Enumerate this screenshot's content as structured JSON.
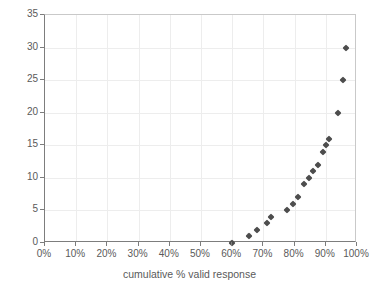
{
  "chart_data": {
    "type": "scatter",
    "title": "",
    "xlabel": "cumulative % valid response",
    "ylabel": "",
    "xlim": [
      0,
      100
    ],
    "ylim": [
      0,
      35
    ],
    "grid": true,
    "legend": null,
    "marker": {
      "shape": "diamond",
      "color": "#4d4d4d",
      "size_px": 5
    },
    "xtick_labels": [
      "0%",
      "10%",
      "20%",
      "30%",
      "40%",
      "50%",
      "60%",
      "70%",
      "80%",
      "90%",
      "100%"
    ],
    "xtick_values": [
      0,
      10,
      20,
      30,
      40,
      50,
      60,
      70,
      80,
      90,
      100
    ],
    "ytick_labels": [
      "0",
      "5",
      "10",
      "15",
      "20",
      "25",
      "30",
      "35"
    ],
    "ytick_values": [
      0,
      5,
      10,
      15,
      20,
      25,
      30,
      35
    ],
    "x": [
      60,
      65.5,
      68,
      71,
      72.5,
      77.5,
      79.5,
      81,
      83,
      84.5,
      86,
      87.5,
      89,
      90,
      91,
      94,
      95.5,
      96.5
    ],
    "y": [
      0,
      1,
      2,
      3,
      4,
      5,
      6,
      7,
      9,
      10,
      11,
      12,
      14,
      15,
      16,
      20,
      25,
      30
    ],
    "points": [
      {
        "x": 60,
        "y": 0
      },
      {
        "x": 65.5,
        "y": 1
      },
      {
        "x": 68,
        "y": 2
      },
      {
        "x": 71,
        "y": 3
      },
      {
        "x": 72.5,
        "y": 4
      },
      {
        "x": 77.5,
        "y": 5
      },
      {
        "x": 79.5,
        "y": 6
      },
      {
        "x": 81,
        "y": 7
      },
      {
        "x": 83,
        "y": 9
      },
      {
        "x": 84.5,
        "y": 10
      },
      {
        "x": 86,
        "y": 11
      },
      {
        "x": 87.5,
        "y": 12
      },
      {
        "x": 89,
        "y": 14
      },
      {
        "x": 90,
        "y": 15
      },
      {
        "x": 91,
        "y": 16
      },
      {
        "x": 94,
        "y": 20
      },
      {
        "x": 95.5,
        "y": 25
      },
      {
        "x": 96.5,
        "y": 30
      }
    ]
  },
  "colors": {
    "marker": "#4d4d4d",
    "axis": "#7d7d7d",
    "grid": "#ededed",
    "text": "#5a5a5a",
    "background": "#ffffff"
  }
}
